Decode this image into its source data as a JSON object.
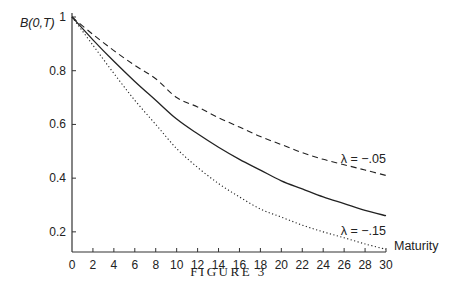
{
  "chart_data": {
    "type": "line",
    "title": "",
    "caption": "FIGURE 3",
    "xlabel": "Maturity",
    "ylabel": "B(0,T)",
    "xlim": [
      0,
      30
    ],
    "ylim": [
      0.125,
      1
    ],
    "grid": false,
    "x_ticks": [
      0,
      2,
      4,
      6,
      8,
      10,
      12,
      14,
      16,
      18,
      20,
      22,
      24,
      26,
      28,
      30
    ],
    "y_ticks": [
      {
        "value": 0.2,
        "label": "0.2"
      },
      {
        "value": 0.4,
        "label": "0.4"
      },
      {
        "value": 0.6,
        "label": "0.6"
      },
      {
        "value": 0.8,
        "label": "0.8"
      },
      {
        "value": 1.0,
        "label": "1"
      }
    ],
    "x": [
      0,
      2,
      4,
      6,
      8,
      10,
      12,
      14,
      16,
      18,
      20,
      22,
      24,
      26,
      28,
      30
    ],
    "series": [
      {
        "name": "λ = −.05",
        "style": "dashed",
        "annotation": "λ = −.05",
        "values": [
          1.0,
          0.935,
          0.875,
          0.82,
          0.77,
          0.7,
          0.665,
          0.625,
          0.59,
          0.555,
          0.525,
          0.495,
          0.47,
          0.45,
          0.43,
          0.41
        ]
      },
      {
        "name": "base",
        "style": "solid",
        "values": [
          1.0,
          0.915,
          0.835,
          0.76,
          0.69,
          0.62,
          0.565,
          0.515,
          0.47,
          0.43,
          0.39,
          0.36,
          0.33,
          0.305,
          0.28,
          0.26
        ]
      },
      {
        "name": "λ = −.15",
        "style": "dotted",
        "annotation": "λ = −.15",
        "values": [
          1.0,
          0.895,
          0.79,
          0.69,
          0.6,
          0.51,
          0.44,
          0.38,
          0.33,
          0.285,
          0.255,
          0.225,
          0.2,
          0.178,
          0.155,
          0.135
        ]
      }
    ]
  }
}
